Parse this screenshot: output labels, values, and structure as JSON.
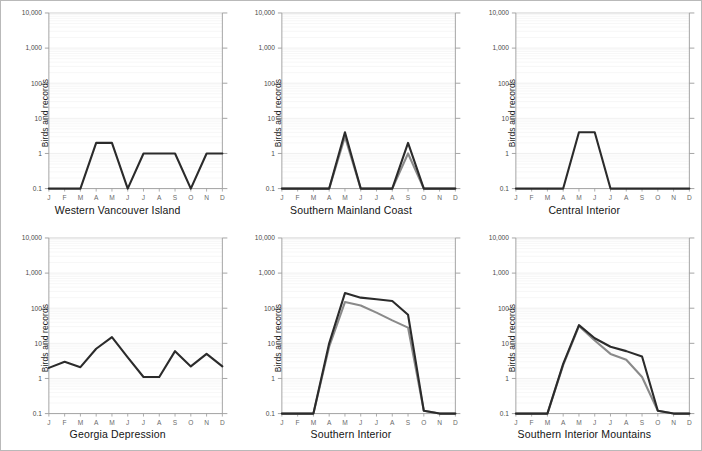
{
  "figure": {
    "y_axis_label": "Birds and records",
    "y_ticks": [
      "10,000",
      "1,000",
      "100",
      "10",
      "1",
      "0.1"
    ],
    "months": [
      "J",
      "F",
      "M",
      "A",
      "M",
      "J",
      "J",
      "A",
      "S",
      "O",
      "N",
      "D"
    ],
    "line_color_primary": "#2b2b2b",
    "line_color_secondary": "#8a8a8a",
    "frame_color": "#b9b9b9",
    "grid_color": "#e9e9e9",
    "axis_color": "#9a9a9a"
  },
  "chart_data": [
    {
      "type": "line",
      "title": "Western Vancouver Island",
      "xlabel": "",
      "ylabel": "Birds and records",
      "x": [
        "J",
        "F",
        "M",
        "A",
        "M",
        "J",
        "J",
        "A",
        "S",
        "O",
        "N",
        "D"
      ],
      "ylim": [
        0.1,
        10000
      ],
      "yscale": "log",
      "ytick_labels": [
        "10,000",
        "1,000",
        "100",
        "10",
        "1",
        "0.1"
      ],
      "grid": true,
      "legend": "none",
      "series": [
        {
          "name": "Birds",
          "color": "#2b2b2b",
          "values": [
            0.1,
            0.1,
            0.1,
            2,
            2,
            0.1,
            1,
            1,
            1,
            0.1,
            1,
            1
          ]
        }
      ]
    },
    {
      "type": "line",
      "title": "Southern Mainland Coast",
      "xlabel": "",
      "ylabel": "Birds and records",
      "x": [
        "J",
        "F",
        "M",
        "A",
        "M",
        "J",
        "J",
        "A",
        "S",
        "O",
        "N",
        "D"
      ],
      "ylim": [
        0.1,
        10000
      ],
      "yscale": "log",
      "ytick_labels": [
        "10,000",
        "1,000",
        "100",
        "10",
        "1",
        "0.1"
      ],
      "grid": true,
      "legend": "none",
      "series": [
        {
          "name": "Birds",
          "color": "#2b2b2b",
          "values": [
            0.1,
            0.1,
            0.1,
            0.1,
            4,
            0.1,
            0.1,
            0.1,
            2,
            0.1,
            0.1,
            0.1
          ]
        },
        {
          "name": "Records",
          "color": "#8a8a8a",
          "values": [
            0.1,
            0.1,
            0.1,
            0.1,
            3,
            0.1,
            0.1,
            0.1,
            1,
            0.1,
            0.1,
            0.1
          ]
        }
      ]
    },
    {
      "type": "line",
      "title": "Central Interior",
      "xlabel": "",
      "ylabel": "Birds and records",
      "x": [
        "J",
        "F",
        "M",
        "A",
        "M",
        "J",
        "J",
        "A",
        "S",
        "O",
        "N",
        "D"
      ],
      "ylim": [
        0.1,
        10000
      ],
      "yscale": "log",
      "ytick_labels": [
        "10,000",
        "1,000",
        "100",
        "10",
        "1",
        "0.1"
      ],
      "grid": true,
      "legend": "none",
      "series": [
        {
          "name": "Birds",
          "color": "#2b2b2b",
          "values": [
            0.1,
            0.1,
            0.1,
            0.1,
            4,
            4,
            0.1,
            0.1,
            0.1,
            0.1,
            0.1,
            0.1
          ]
        }
      ]
    },
    {
      "type": "line",
      "title": "Georgia Depression",
      "xlabel": "",
      "ylabel": "Birds and records",
      "x": [
        "J",
        "F",
        "M",
        "A",
        "M",
        "J",
        "J",
        "A",
        "S",
        "O",
        "N",
        "D"
      ],
      "ylim": [
        0.1,
        10000
      ],
      "yscale": "log",
      "ytick_labels": [
        "10,000",
        "1,000",
        "100",
        "10",
        "1",
        "0.1"
      ],
      "grid": true,
      "legend": "none",
      "series": [
        {
          "name": "Birds",
          "color": "#2b2b2b",
          "values": [
            2,
            3,
            2.1,
            7,
            15,
            4,
            1.1,
            1.1,
            6,
            2.2,
            5,
            2.2
          ]
        }
      ]
    },
    {
      "type": "line",
      "title": "Southern Interior",
      "xlabel": "",
      "ylabel": "Birds and records",
      "x": [
        "J",
        "F",
        "M",
        "A",
        "M",
        "J",
        "J",
        "A",
        "S",
        "O",
        "N",
        "D"
      ],
      "ylim": [
        0.1,
        10000
      ],
      "yscale": "log",
      "ytick_labels": [
        "10,000",
        "1,000",
        "100",
        "10",
        "1",
        "0.1"
      ],
      "grid": true,
      "legend": "none",
      "series": [
        {
          "name": "Birds",
          "color": "#2b2b2b",
          "values": [
            0.1,
            0.1,
            0.1,
            10,
            270,
            200,
            180,
            160,
            65,
            0.12,
            0.1,
            0.1
          ]
        },
        {
          "name": "Records",
          "color": "#8a8a8a",
          "values": [
            0.1,
            0.1,
            0.1,
            8,
            150,
            120,
            75,
            45,
            28,
            0.12,
            0.1,
            0.1
          ]
        }
      ]
    },
    {
      "type": "line",
      "title": "Southern Interior Mountains",
      "xlabel": "",
      "ylabel": "Birds and records",
      "x": [
        "J",
        "F",
        "M",
        "A",
        "M",
        "J",
        "J",
        "A",
        "S",
        "O",
        "N",
        "D"
      ],
      "ylim": [
        0.1,
        10000
      ],
      "yscale": "log",
      "ytick_labels": [
        "10,000",
        "1,000",
        "100",
        "10",
        "1",
        "0.1"
      ],
      "grid": true,
      "legend": "none",
      "series": [
        {
          "name": "Birds",
          "color": "#2b2b2b",
          "values": [
            0.1,
            0.1,
            0.1,
            2.6,
            33,
            14,
            8,
            6,
            4.2,
            0.12,
            0.1,
            0.1
          ]
        },
        {
          "name": "Records",
          "color": "#8a8a8a",
          "values": [
            0.1,
            0.1,
            0.1,
            2.4,
            31,
            12,
            5,
            3.4,
            1.1,
            0.12,
            0.1,
            0.1
          ]
        }
      ]
    }
  ]
}
